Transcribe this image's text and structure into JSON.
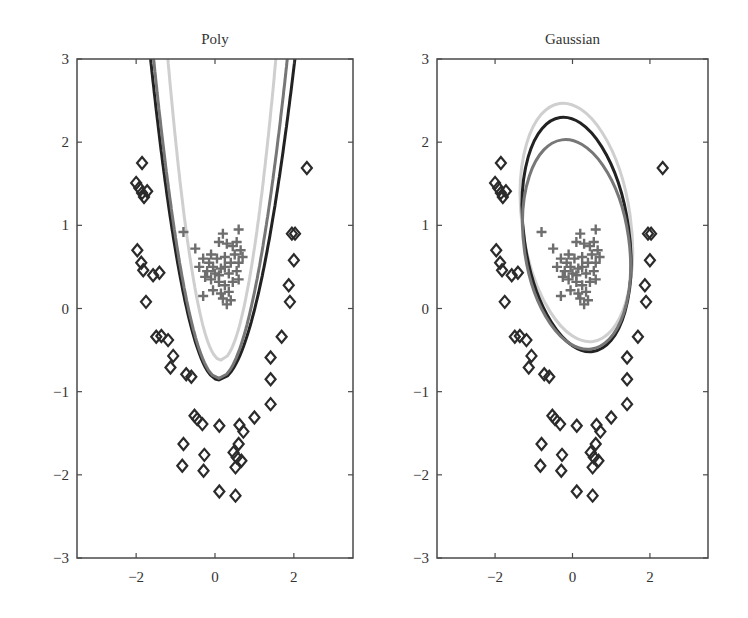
{
  "figure": {
    "colors": {
      "frame": "#4a4a4a",
      "text": "#333333",
      "diamond": "#2b2b2b",
      "cross": "#6e6e6e",
      "curve_dark": "#222222",
      "curve_mid": "#777777",
      "curve_light": "#cfcfcf"
    }
  },
  "chart_data": [
    {
      "type": "scatter",
      "title": "Poly",
      "xlabel": "",
      "ylabel": "",
      "xlim": [
        -3.5,
        3.5
      ],
      "ylim": [
        -3,
        3
      ],
      "xticks": [
        -2,
        0,
        2
      ],
      "yticks": [
        -3,
        -2,
        -1,
        0,
        1,
        2,
        3
      ],
      "xtick_labels": [
        "−2",
        "0",
        "2"
      ],
      "ytick_labels": [
        "−3",
        "−2",
        "−1",
        "0",
        "1",
        "2",
        "3"
      ],
      "grid": false,
      "legend": null,
      "series": [
        {
          "name": "class-diamond",
          "marker": "diamond",
          "points": [
            [
              -1.85,
              1.75
            ],
            [
              -2.0,
              1.51
            ],
            [
              -1.92,
              1.45
            ],
            [
              -1.85,
              1.39
            ],
            [
              -1.72,
              1.41
            ],
            [
              -1.8,
              1.34
            ],
            [
              -1.97,
              0.7
            ],
            [
              -1.87,
              0.55
            ],
            [
              -1.82,
              0.46
            ],
            [
              -1.57,
              0.4
            ],
            [
              -1.41,
              0.43
            ],
            [
              -1.75,
              0.08
            ],
            [
              -1.49,
              -0.34
            ],
            [
              -1.36,
              -0.33
            ],
            [
              -1.19,
              -0.38
            ],
            [
              -1.06,
              -0.57
            ],
            [
              -1.13,
              -0.71
            ],
            [
              -0.73,
              -0.79
            ],
            [
              -0.6,
              -0.82
            ],
            [
              2.33,
              1.69
            ],
            [
              1.95,
              0.9
            ],
            [
              2.03,
              0.9
            ],
            [
              2.0,
              0.58
            ],
            [
              1.87,
              0.28
            ],
            [
              1.9,
              0.08
            ],
            [
              1.69,
              -0.34
            ],
            [
              1.41,
              -0.59
            ],
            [
              1.41,
              -0.85
            ],
            [
              1.41,
              -1.15
            ],
            [
              1.0,
              -1.31
            ],
            [
              -0.52,
              -1.29
            ],
            [
              -0.45,
              -1.33
            ],
            [
              -0.32,
              -1.39
            ],
            [
              0.11,
              -1.41
            ],
            [
              0.62,
              -1.4
            ],
            [
              0.72,
              -1.48
            ],
            [
              0.6,
              -1.63
            ],
            [
              0.47,
              -1.73
            ],
            [
              0.55,
              -1.79
            ],
            [
              0.67,
              -1.83
            ],
            [
              0.52,
              -1.91
            ],
            [
              -0.8,
              -1.63
            ],
            [
              -0.83,
              -1.89
            ],
            [
              -0.27,
              -1.76
            ],
            [
              -0.29,
              -1.95
            ],
            [
              0.11,
              -2.2
            ],
            [
              0.52,
              -2.25
            ]
          ]
        },
        {
          "name": "class-cross",
          "marker": "plus",
          "points": [
            [
              -0.8,
              0.92
            ],
            [
              0.6,
              0.95
            ],
            [
              0.2,
              0.9
            ],
            [
              0.1,
              0.8
            ],
            [
              0.3,
              0.78
            ],
            [
              0.45,
              0.75
            ],
            [
              0.55,
              0.8
            ],
            [
              0.65,
              0.7
            ],
            [
              -0.5,
              0.72
            ],
            [
              -0.3,
              0.6
            ],
            [
              -0.1,
              0.65
            ],
            [
              0.05,
              0.6
            ],
            [
              0.25,
              0.62
            ],
            [
              0.4,
              0.55
            ],
            [
              0.6,
              0.55
            ],
            [
              0.7,
              0.62
            ],
            [
              -0.4,
              0.5
            ],
            [
              -0.2,
              0.45
            ],
            [
              -0.05,
              0.5
            ],
            [
              0.15,
              0.48
            ],
            [
              0.35,
              0.42
            ],
            [
              0.55,
              0.45
            ],
            [
              -0.25,
              0.38
            ],
            [
              -0.1,
              0.35
            ],
            [
              0.1,
              0.32
            ],
            [
              0.25,
              0.28
            ],
            [
              0.45,
              0.32
            ],
            [
              0.6,
              0.35
            ],
            [
              -0.05,
              0.22
            ],
            [
              0.15,
              0.18
            ],
            [
              0.35,
              0.2
            ],
            [
              0.2,
              0.12
            ],
            [
              0.4,
              0.1
            ],
            [
              -0.3,
              0.15
            ],
            [
              0.3,
              0.05
            ],
            [
              0.1,
              0.4
            ],
            [
              -0.15,
              0.55
            ],
            [
              0.5,
              0.65
            ],
            [
              0.0,
              0.42
            ],
            [
              0.25,
              0.5
            ]
          ]
        }
      ],
      "curves": [
        {
          "name": "boundary-dark",
          "shape": "parabola",
          "vertex": [
            0.1,
            -0.86
          ],
          "x_at_top": [
            -1.7,
            2.1
          ],
          "color": "#222222"
        },
        {
          "name": "boundary-mid",
          "shape": "parabola",
          "vertex": [
            0.1,
            -0.84
          ],
          "x_at_top": [
            -1.62,
            1.9
          ],
          "color": "#777777"
        },
        {
          "name": "boundary-light",
          "shape": "parabola",
          "vertex": [
            0.15,
            -0.62
          ],
          "x_at_top": [
            -1.25,
            1.6
          ],
          "color": "#cfcfcf"
        }
      ]
    },
    {
      "type": "scatter",
      "title": "Gaussian",
      "xlabel": "",
      "ylabel": "",
      "xlim": [
        -3.5,
        3.5
      ],
      "ylim": [
        -3,
        3
      ],
      "xticks": [
        -2,
        0,
        2
      ],
      "yticks": [
        -3,
        -2,
        -1,
        0,
        1,
        2,
        3
      ],
      "xtick_labels": [
        "−2",
        "0",
        "2"
      ],
      "ytick_labels": [
        "−3",
        "−2",
        "−1",
        "0",
        "1",
        "2",
        "3"
      ],
      "grid": false,
      "legend": null,
      "series": [
        {
          "name": "class-diamond",
          "marker": "diamond",
          "same_as_panel": 0
        },
        {
          "name": "class-cross",
          "marker": "plus",
          "same_as_panel": 0
        }
      ],
      "curves": [
        {
          "name": "boundary-light",
          "shape": "ellipse",
          "top_y": 2.48,
          "bottom_y": -0.41,
          "left_x": -1.3,
          "right_x": 1.5,
          "color": "#cfcfcf"
        },
        {
          "name": "boundary-dark",
          "shape": "ellipse",
          "top_y": 2.31,
          "bottom_y": -0.53,
          "left_x": -1.25,
          "right_x": 1.46,
          "color": "#222222"
        },
        {
          "name": "boundary-mid",
          "shape": "ellipse",
          "top_y": 2.04,
          "bottom_y": -0.5,
          "left_x": -1.25,
          "right_x": 1.46,
          "color": "#777777"
        }
      ]
    }
  ]
}
